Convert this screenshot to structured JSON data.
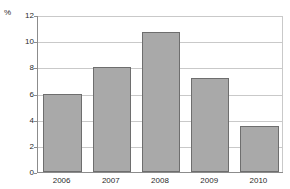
{
  "chart_data": {
    "type": "bar",
    "title": "",
    "subtitle": "",
    "xlabel": "",
    "ylabel": "%",
    "unit_label": "%",
    "categories": [
      "2006",
      "2007",
      "2008",
      "2009",
      "2010"
    ],
    "values": [
      6.0,
      8.0,
      10.7,
      7.2,
      3.5
    ],
    "ylim": [
      0,
      12
    ],
    "ytick_values": [
      0,
      2,
      4,
      6,
      8,
      10,
      12
    ],
    "ytick_labels": [
      "0",
      "2",
      "4",
      "6",
      "8",
      "10",
      "12"
    ],
    "grid": true,
    "grid_axis": "y",
    "legend": false,
    "legend_position": "none",
    "series": [
      {
        "name": "",
        "values": [
          6.0,
          8.0,
          10.7,
          7.2,
          3.5
        ]
      }
    ],
    "colors": {
      "bar_fill": "#a9a9a9",
      "bar_border": "#6e6e6e",
      "gridline": "#c9c9c9",
      "axis": "#8c8c8c",
      "text": "#2b2b2b",
      "background": "#ffffff"
    }
  }
}
